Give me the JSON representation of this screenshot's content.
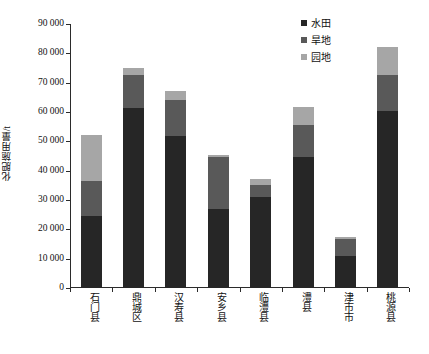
{
  "chart_data": {
    "type": "bar",
    "subtype": "stacked-bar",
    "title": "",
    "xlabel": "",
    "ylabel": "化肥施用量/t",
    "ylim": [
      0,
      90000
    ],
    "ytick_step": 10000,
    "ytick_labels": [
      "0",
      "10 000",
      "20 000",
      "30 000",
      "40 000",
      "50 000",
      "60 000",
      "70 000",
      "80 000",
      "90 000"
    ],
    "ytick_values": [
      0,
      10000,
      20000,
      30000,
      40000,
      50000,
      60000,
      70000,
      80000,
      90000
    ],
    "grid": false,
    "legend_position": "top-right",
    "categories": [
      "石门县",
      "鼎城区",
      "汉寿县",
      "安乡县",
      "临澧县",
      "澧县",
      "津市市",
      "桃源县"
    ],
    "series": [
      {
        "name": "水田",
        "color": "#262626",
        "values": [
          24500,
          61500,
          51800,
          26800,
          31000,
          44600,
          11000,
          60200
        ]
      },
      {
        "name": "旱地",
        "color": "#595959",
        "values": [
          12000,
          11200,
          12400,
          17700,
          4200,
          10900,
          5700,
          12500
        ]
      },
      {
        "name": "园地",
        "color": "#a6a6a6",
        "values": [
          15500,
          2300,
          3100,
          800,
          2000,
          6300,
          800,
          9600
        ]
      }
    ],
    "totals": [
      52000,
      75000,
      67300,
      45300,
      37200,
      61800,
      17500,
      82300
    ]
  },
  "colors": {
    "axis": "#2b2b2b",
    "text": "#111111",
    "background": "#ffffff",
    "series_shuitian": "#262626",
    "series_handi": "#595959",
    "series_yuandi": "#a6a6a6"
  }
}
